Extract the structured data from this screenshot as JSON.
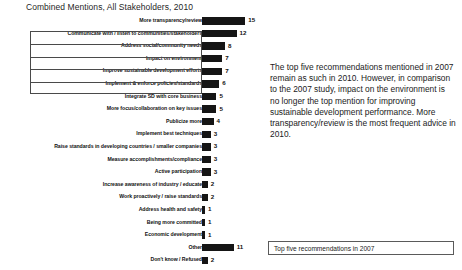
{
  "chart_data": {
    "type": "bar",
    "orientation": "horizontal",
    "title": "Combined Mentions, All Stakeholders, 2010",
    "xlabel": "",
    "ylabel": "",
    "grid": false,
    "xlim": [
      0,
      15
    ],
    "categories": [
      "More transparency/review",
      "Communicate with / listen to communities/stakeholders",
      "Address social/community needs",
      "Impact on environment",
      "Improve sustainable development efforts",
      "Implement & enforce policies/standards",
      "Integrate SD with core business",
      "More focus/collaboration on key issues",
      "Publicize more",
      "Implement best techniques",
      "Raise standards in developing countries / smaller companies",
      "Measure accomplishments/compliance",
      "Active participation",
      "Increase awareness of industry / educate",
      "Work proactively / raise standards",
      "Address health and safety",
      "Being more committed",
      "Economic development",
      "Other",
      "Don't know / Refused"
    ],
    "values": [
      15,
      12,
      8,
      7,
      7,
      6,
      5,
      5,
      4,
      3,
      3,
      3,
      3,
      2,
      2,
      1,
      1,
      1,
      11,
      2
    ],
    "highlighted_count": 5,
    "bar_color": "#151515",
    "annotation": "The top five recommendations mentioned in 2007 remain as such in 2010. However, in comparison to the 2007 study, impact on the environment is no longer the top mention for improving sustainable development performance. More transparency/review is the most frequent advice in 2010.",
    "legend": "Top five recommendations in 2007"
  }
}
